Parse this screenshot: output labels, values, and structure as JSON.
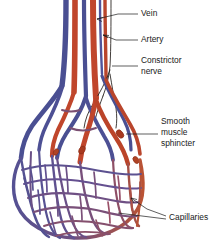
{
  "figure": {
    "width": 221,
    "height": 243,
    "background": "#ffffff"
  },
  "colors": {
    "vein": "#4a4f92",
    "vein_deep": "#3c3f7e",
    "artery": "#c0462c",
    "artery_deep": "#a8391f",
    "capillary_blue": "#5a5490",
    "capillary_mix": "#7b4f72",
    "capillary_red": "#b85336",
    "nerve": "#201a16",
    "leader": "#1a1a1a",
    "text": "#1a1a1a"
  },
  "labels": [
    {
      "id": "vein",
      "text": "Vein",
      "x": 141,
      "y": 14,
      "leader": "M138,14 L118,14 L96,19"
    },
    {
      "id": "artery",
      "text": "Artery",
      "x": 141,
      "y": 40,
      "leader": "M138,40 L116,40 L86,33"
    },
    {
      "id": "constrictor-nerve",
      "line1": "Constrictor",
      "line2": "nerve",
      "x": 141,
      "y": 62,
      "leader": "M138,66 L114,66"
    },
    {
      "id": "smooth-muscle-sphincter",
      "line1": "Smooth",
      "line2": "muscle",
      "line3": "sphincter",
      "x": 161,
      "y": 121,
      "leader": "M158,134 L136,134"
    },
    {
      "id": "capillaries",
      "text": "Capillaries",
      "x": 169,
      "y": 218,
      "leader1": "M166,216 L146,209 L132,199",
      "leader2": "M166,219 L120,214"
    }
  ],
  "structures": {
    "vein_label": "Vein",
    "artery_label": "Artery",
    "nerve_label": "Constrictor nerve",
    "sphincter_label": "Smooth muscle sphincter",
    "capillaries_label": "Capillaries"
  }
}
